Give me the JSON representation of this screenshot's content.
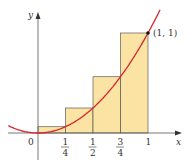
{
  "diagram": {
    "type": "riemann-sum-right-endpoints",
    "function": "y = x^2",
    "axes": {
      "x_label": "x",
      "y_label": "y",
      "origin_label": "0"
    },
    "x_ticks": [
      {
        "num": "1",
        "den": "4",
        "value": 0.25
      },
      {
        "num": "1",
        "den": "2",
        "value": 0.5
      },
      {
        "num": "3",
        "den": "4",
        "value": 0.75
      },
      {
        "label": "1",
        "value": 1
      }
    ],
    "point_label": "(1, 1)",
    "rectangles": [
      {
        "x0": 0,
        "x1": 0.25,
        "height": 0.0625
      },
      {
        "x0": 0.25,
        "x1": 0.5,
        "height": 0.25
      },
      {
        "x0": 0.5,
        "x1": 0.75,
        "height": 0.5625
      },
      {
        "x0": 0.75,
        "x1": 1,
        "height": 1
      }
    ],
    "colors": {
      "curve": "#d6262e",
      "rect_fill": "#fbe3a3",
      "rect_stroke": "#444444",
      "axis": "#555555"
    }
  }
}
